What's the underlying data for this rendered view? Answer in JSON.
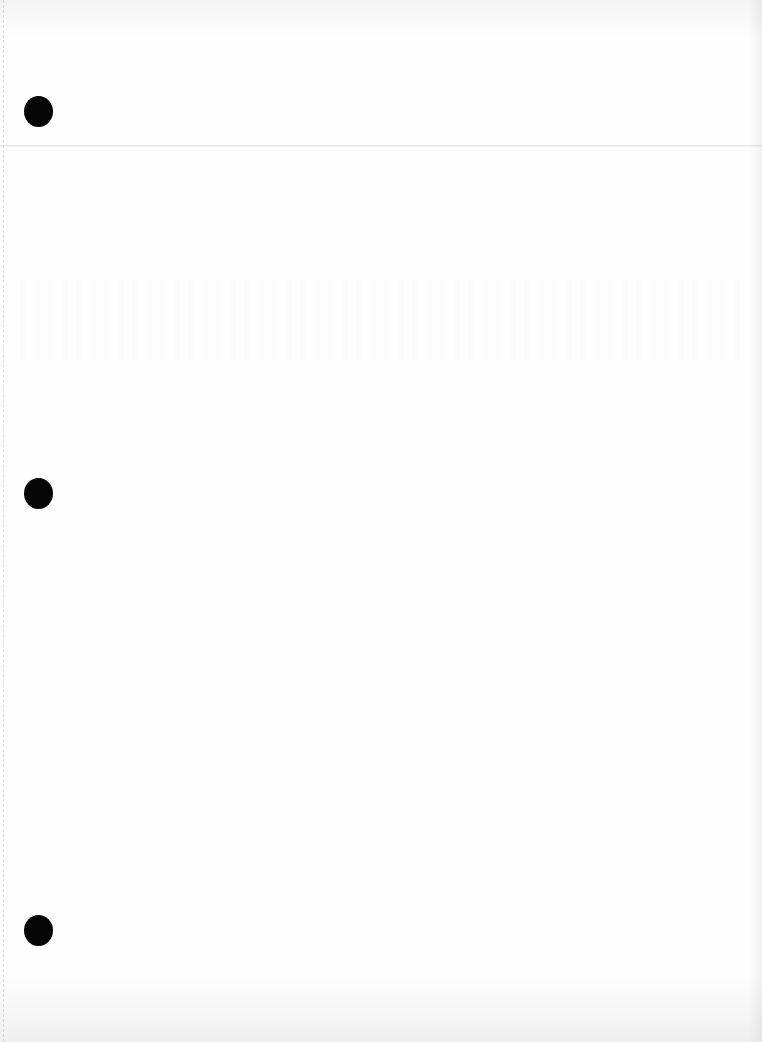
{
  "document": {
    "type": "blank scanned page",
    "text_content": "",
    "punch_holes": 3,
    "colors": {
      "paper": "#fefefe",
      "punch_hole": "#050505"
    }
  }
}
